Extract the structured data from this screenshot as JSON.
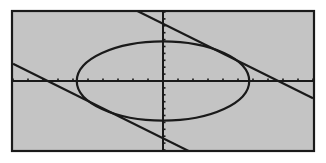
{
  "screen": {
    "background": "#c4c4c4",
    "frame_color": "#1a1a1a",
    "ink_color": "#1a1a1a"
  },
  "chart_data": {
    "type": "line",
    "title": "",
    "xlabel": "",
    "ylabel": "",
    "xlim": [
      -10,
      10
    ],
    "ylim": [
      -10,
      10
    ],
    "xscl": 1,
    "yscl": 1,
    "grid": false,
    "axes": true,
    "series": [
      {
        "name": "ellipse",
        "kind": "ellipse",
        "center": [
          0,
          0
        ],
        "a": 5.75,
        "b": 5.75
      },
      {
        "name": "upper-tangent-line",
        "kind": "line",
        "slope": -1.08,
        "intercept": 8.3
      },
      {
        "name": "lower-tangent-line",
        "kind": "line",
        "slope": -1.08,
        "intercept": -8.3
      }
    ]
  }
}
